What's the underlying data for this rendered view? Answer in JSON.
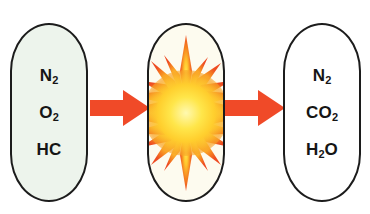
{
  "diagram": {
    "type": "process-flow",
    "background_color": "#ffffff",
    "stages": [
      {
        "id": "inputs",
        "role": "reactants",
        "fill_color": "#edf4ec",
        "stroke_color": "#1c1c1c",
        "items": [
          {
            "id": "nitrogen",
            "base": "N",
            "sub": "2",
            "tail": ""
          },
          {
            "id": "oxygen",
            "base": "O",
            "sub": "2",
            "tail": ""
          },
          {
            "id": "hydrocarbon",
            "base": "HC",
            "sub": "",
            "tail": ""
          }
        ]
      },
      {
        "id": "process",
        "role": "combustion",
        "fill_color": "#fdfbef",
        "stroke_color": "#1c1c1c",
        "icon": "explosion-starburst-icon",
        "items": []
      },
      {
        "id": "outputs",
        "role": "products",
        "fill_color": "#ffffff",
        "stroke_color": "#1c1c1c",
        "items": [
          {
            "id": "nitrogen",
            "base": "N",
            "sub": "2",
            "tail": ""
          },
          {
            "id": "carbon-dioxide",
            "base": "CO",
            "sub": "2",
            "tail": ""
          },
          {
            "id": "water",
            "base": "H",
            "sub": "2",
            "tail": "O"
          }
        ]
      }
    ],
    "arrows": [
      {
        "id": "arrow-in",
        "direction": "right",
        "color": "#f04a28"
      },
      {
        "id": "arrow-out",
        "direction": "right",
        "color": "#f04a28"
      }
    ],
    "starburst": {
      "core_color": "#ffe84a",
      "mid_color": "#ffc42e",
      "spike_color": "#f26522",
      "spike_count": 20
    }
  }
}
